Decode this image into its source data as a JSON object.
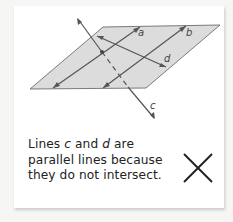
{
  "figure": {
    "labels": {
      "a": "a",
      "b": "b",
      "c": "c",
      "d": "d"
    },
    "plane_color": "#d8d8d8",
    "line_color": "#555555"
  },
  "caption": {
    "line1_prefix": "Lines ",
    "var1": "c",
    "line1_mid": " and ",
    "var2": "d",
    "line1_suffix": " are",
    "line2": "parallel lines because",
    "line3": "they do not intersect."
  },
  "verdict": {
    "icon": "x-mark-icon",
    "meaning": "incorrect"
  }
}
